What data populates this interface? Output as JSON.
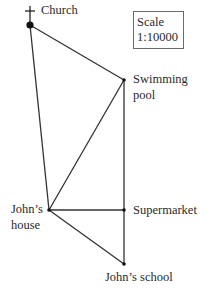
{
  "diagram": {
    "scale": {
      "title": "Scale",
      "ratio": "1:10000"
    },
    "points": [
      {
        "id": "church",
        "label": "Church",
        "x": 30,
        "y": 25
      },
      {
        "id": "swimming-pool",
        "label_line1": "Swimming",
        "label_line2": "pool",
        "x": 124,
        "y": 80
      },
      {
        "id": "johns-house",
        "label_line1": "John’s",
        "label_line2": "house",
        "x": 49,
        "y": 210
      },
      {
        "id": "supermarket",
        "label": "Supermarket",
        "x": 124,
        "y": 210
      },
      {
        "id": "johns-school",
        "label": "John’s school",
        "x": 124,
        "y": 264
      }
    ],
    "edges": [
      [
        "church",
        "swimming-pool"
      ],
      [
        "church",
        "johns-house"
      ],
      [
        "johns-house",
        "swimming-pool"
      ],
      [
        "swimming-pool",
        "supermarket"
      ],
      [
        "supermarket",
        "johns-school"
      ],
      [
        "johns-house",
        "supermarket"
      ],
      [
        "johns-house",
        "johns-school"
      ]
    ],
    "line_color": "#333333"
  }
}
